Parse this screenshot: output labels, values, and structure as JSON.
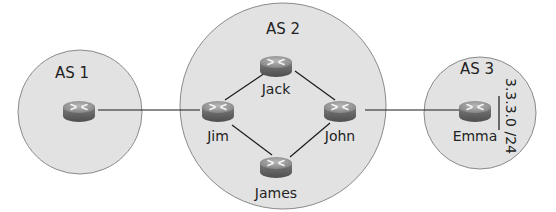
{
  "diagram": {
    "type": "network-topology",
    "colors": {
      "as_fill": "#e2e2e2",
      "as_stroke": "#8a8a8a",
      "link": "#1a1a1a",
      "router_top": "#9a9a9a",
      "router_side": "#6a6a6a"
    },
    "autonomous_systems": [
      {
        "id": "as1",
        "label": "AS 1"
      },
      {
        "id": "as2",
        "label": "AS 2"
      },
      {
        "id": "as3",
        "label": "AS 3"
      }
    ],
    "routers": [
      {
        "id": "r_as1",
        "label": "",
        "as": "AS 1"
      },
      {
        "id": "jack",
        "label": "Jack",
        "as": "AS 2"
      },
      {
        "id": "jim",
        "label": "Jim",
        "as": "AS 2"
      },
      {
        "id": "john",
        "label": "John",
        "as": "AS 2"
      },
      {
        "id": "james",
        "label": "James",
        "as": "AS 2"
      },
      {
        "id": "emma",
        "label": "Emma",
        "as": "AS 3"
      }
    ],
    "links": [
      {
        "from": "r_as1",
        "to": "jim"
      },
      {
        "from": "jim",
        "to": "jack"
      },
      {
        "from": "jim",
        "to": "james"
      },
      {
        "from": "jack",
        "to": "john"
      },
      {
        "from": "james",
        "to": "john"
      },
      {
        "from": "john",
        "to": "emma"
      }
    ],
    "prefix": {
      "label": "3.3.3.0 /24",
      "attached_to": "Emma"
    }
  }
}
